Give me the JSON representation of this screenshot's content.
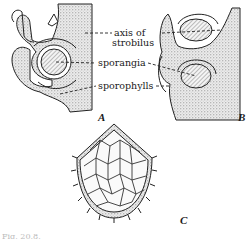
{
  "figure": {
    "labels": {
      "axis": "axis of",
      "axis_line2": "strobilus",
      "sporangia": "sporangia",
      "sporophylls": "sporophylls"
    },
    "panels": {
      "a": "A",
      "b": "B",
      "c": "C"
    },
    "caption": "Fig. 20.8."
  }
}
